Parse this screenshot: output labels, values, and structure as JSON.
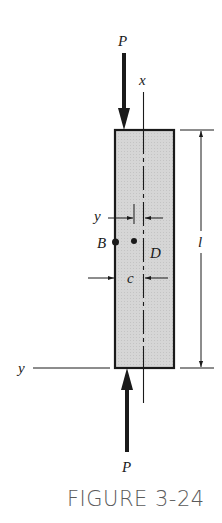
{
  "figure": {
    "caption": "FIGURE 3-24",
    "labels": {
      "load_top": "P",
      "load_bottom": "P",
      "axis_x": "x",
      "axis_y": "y",
      "length": "l",
      "point_b": "B",
      "point_d": "D",
      "offset_y": "y",
      "offset_c": "c"
    },
    "colors": {
      "column_fill": "#d4d4d4",
      "outline": "#1a1a1a",
      "caption": "#5a5a5a"
    }
  }
}
